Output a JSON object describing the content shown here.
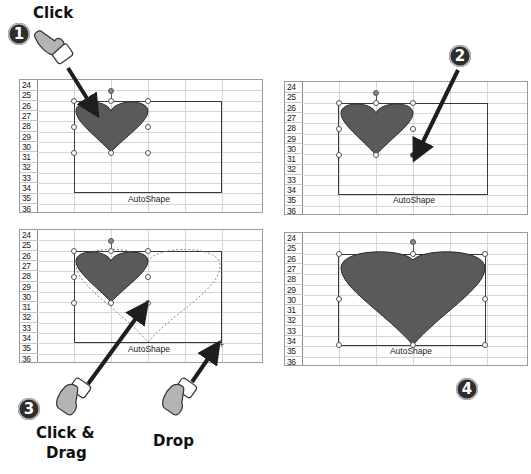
{
  "steps": [
    {
      "number": "1",
      "label": "Click"
    },
    {
      "number": "2",
      "label": ""
    },
    {
      "number": "3",
      "label_line1": "Click &",
      "label_line2": "Drag"
    },
    {
      "number": "4",
      "label": ""
    }
  ],
  "drop_label": "Drop",
  "sheet": {
    "row_numbers": [
      "24",
      "25",
      "26",
      "27",
      "28",
      "29",
      "30",
      "31",
      "32",
      "33",
      "34",
      "35",
      "36"
    ],
    "caption": "AutoShape"
  },
  "panels": [
    {
      "id": "panel-1",
      "state": "heart selected"
    },
    {
      "id": "panel-2",
      "state": "pointer on corner resize handle"
    },
    {
      "id": "panel-3",
      "state": "dragging resize outline"
    },
    {
      "id": "panel-4",
      "state": "heart resized"
    }
  ],
  "colors": {
    "heart_fill": "#5a5a5a",
    "heart_stroke": "#2a2a2a",
    "arrow": "#1e1e1e",
    "badge": "#2e2e2e",
    "grid": "#d6d6d6"
  }
}
